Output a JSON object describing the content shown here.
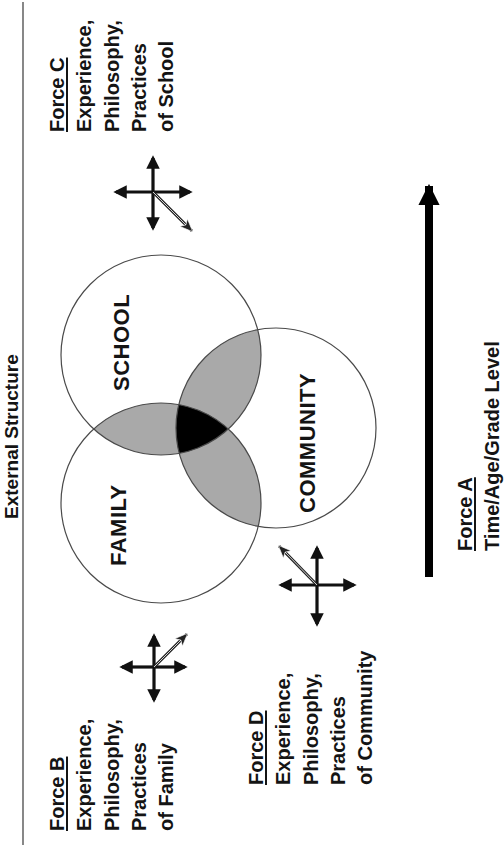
{
  "diagram": {
    "type": "venn-with-force-vectors",
    "orientation": "rotated 90 degrees counter-clockwise",
    "external_structure_label": "External Structure",
    "circles": [
      {
        "id": "school",
        "label": "SCHOOL"
      },
      {
        "id": "family",
        "label": "FAMILY"
      },
      {
        "id": "community",
        "label": "COMMUNITY"
      }
    ],
    "colors": {
      "circle_stroke": "#4a4a4a",
      "pairwise_overlap": "#a9a9a9",
      "triple_overlap": "#000000",
      "text": "#141414"
    },
    "forces": {
      "a": {
        "title": "Force A",
        "lines": [
          "Time/Age/Grade Level"
        ]
      },
      "b": {
        "title": "Force B",
        "lines": [
          "Experience,",
          "Philosophy,",
          "Practices",
          "of Family"
        ]
      },
      "c": {
        "title": "Force C",
        "lines": [
          "Experience,",
          "Philosophy,",
          "Practices",
          "of School"
        ]
      },
      "d": {
        "title": "Force D",
        "lines": [
          "Experience,",
          "Philosophy,",
          "Practices",
          "of Community"
        ]
      }
    }
  }
}
